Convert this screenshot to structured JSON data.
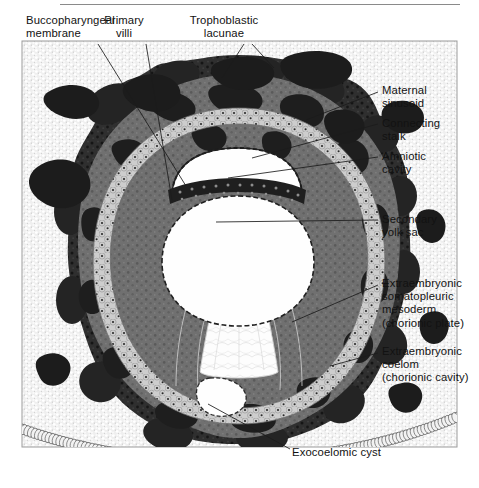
{
  "figure": {
    "type": "histology-diagram",
    "rule_visible": true
  },
  "labels": [
    {
      "id": "buccopharyngeal-membrane",
      "text": "Buccopharyngeal\nmembrane",
      "align": "left",
      "x": 26,
      "y": 14
    },
    {
      "id": "primary-villi",
      "text": "Primary\nvilli",
      "align": "center",
      "x": 124,
      "y": 14
    },
    {
      "id": "trophoblastic-lacunae",
      "text": "Trophoblastic\nlacunae",
      "align": "center",
      "x": 224,
      "y": 14
    },
    {
      "id": "maternal-sinusoid",
      "text": "Maternal\nsinusoid",
      "align": "left",
      "x": 382,
      "y": 84
    },
    {
      "id": "connecting-stalk",
      "text": "Connecting\nstalk",
      "align": "left",
      "x": 382,
      "y": 117
    },
    {
      "id": "amniotic-cavity",
      "text": "Amniotic\ncavity",
      "align": "left",
      "x": 382,
      "y": 150
    },
    {
      "id": "secondary-yolk-sac",
      "text": "Secondary\nyolk sac",
      "align": "left",
      "x": 382,
      "y": 213
    },
    {
      "id": "extraembryonic-somatopleuric-mesoderm",
      "text": "Extraembryonic\nsomatopleuric\nmesoderm\n(chorionic plate)",
      "align": "left",
      "x": 382,
      "y": 277
    },
    {
      "id": "extraembryonic-coelom",
      "text": "Extraembryonic\ncoelom\n(chorionic cavity)",
      "align": "left",
      "x": 382,
      "y": 345
    },
    {
      "id": "exocoelomic-cyst",
      "text": "Exocoelomic cyst",
      "align": "left",
      "x": 292,
      "y": 446
    }
  ],
  "leaders": [
    {
      "id": "leader-buccopharyngeal-membrane",
      "points": "98,44 186,186"
    },
    {
      "id": "leader-primary-villi",
      "points": "146,44 172,200"
    },
    {
      "id": "leader-trophoblastic-lacunae-a",
      "points": "244,44 222,78"
    },
    {
      "id": "leader-trophoblastic-lacunae-b",
      "points": "252,44 274,68"
    },
    {
      "id": "leader-maternal-sinusoid",
      "points": "378,92 306,120"
    },
    {
      "id": "leader-connecting-stalk",
      "points": "378,124 252,158"
    },
    {
      "id": "leader-amniotic-cavity",
      "points": "378,157 228,178"
    },
    {
      "id": "leader-secondary-yolk-sac",
      "points": "378,220 216,222"
    },
    {
      "id": "leader-somatopleuric-mesoderm",
      "points": "378,285 292,322"
    },
    {
      "id": "leader-extraembryonic-coelom",
      "points": "378,353 330,366"
    },
    {
      "id": "leader-exocoelomic-cyst",
      "points": "290,449 208,404"
    }
  ],
  "colors": {
    "background": "#ffffff",
    "endometrial_stroma": "#e8e8e8",
    "syncytiotrophoblast": "#2b2b2b",
    "trabeculae": "#6e6e6e",
    "cytotrophoblast": "#c9c9c9",
    "maternal_blood": "#1a1a1a",
    "cavity": "#fdfdfd",
    "outline": "#1b1b1b",
    "text": "#121212",
    "rule": "#8a8a8a"
  },
  "structures": [
    {
      "id": "endometrial-stroma",
      "name": "Endometrial stroma (stippled)"
    },
    {
      "id": "syncytiotrophoblast",
      "name": "Syncytiotrophoblast ring"
    },
    {
      "id": "trophoblastic-lacunae",
      "name": "Trophoblastic lacunae"
    },
    {
      "id": "cytotrophoblast-layer",
      "name": "Cytotrophoblast cell layer"
    },
    {
      "id": "maternal-sinusoids",
      "name": "Maternal sinusoids in stroma"
    },
    {
      "id": "chorionic-cavity",
      "name": "Extraembryonic coelom"
    },
    {
      "id": "amniotic-cavity",
      "name": "Amniotic cavity"
    },
    {
      "id": "bilaminar-disc",
      "name": "Bilaminar embryonic disc"
    },
    {
      "id": "secondary-yolk-sac",
      "name": "Secondary yolk sac"
    },
    {
      "id": "connecting-stalk",
      "name": "Connecting stalk"
    },
    {
      "id": "exocoelomic-cyst",
      "name": "Exocoelomic cyst"
    },
    {
      "id": "endometrial-epithelium",
      "name": "Endometrial surface epithelium"
    }
  ]
}
